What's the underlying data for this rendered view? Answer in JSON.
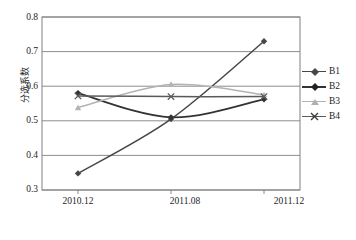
{
  "chart_data": {
    "type": "line",
    "title": "",
    "xlabel": "",
    "ylabel": "分选系数",
    "categories": [
      "2010.12",
      "2011.08",
      "2011.12"
    ],
    "ylim": [
      0.3,
      0.8
    ],
    "yticks": [
      "0.3",
      "0.4",
      "0.5",
      "0.6",
      "0.7",
      "0.8"
    ],
    "ytick_values": [
      0.3,
      0.4,
      0.5,
      0.6,
      0.7,
      0.8
    ],
    "grid": true,
    "legend_position": "right",
    "series": [
      {
        "name": "B1",
        "values": [
          0.348,
          0.505,
          0.73
        ],
        "color": "#474747",
        "marker": "diamond"
      },
      {
        "name": "B2",
        "values": [
          0.58,
          0.51,
          0.562
        ],
        "color": "#333333",
        "marker": "diamond"
      },
      {
        "name": "B3",
        "values": [
          0.538,
          0.605,
          0.575
        ],
        "color": "#b3b3b3",
        "marker": "triangle"
      },
      {
        "name": "B4",
        "values": [
          0.572,
          0.57,
          0.57
        ],
        "color": "#5a5a5a",
        "marker": "cross"
      }
    ]
  },
  "axes": {
    "y_label": "分选系数",
    "y_ticks": [
      "0.8",
      "0.7",
      "0.6",
      "0.5",
      "0.4",
      "0.3"
    ],
    "x_ticks": [
      "2010.12",
      "2011.08",
      "2011.12"
    ]
  },
  "legend": {
    "items": [
      {
        "label": "B1"
      },
      {
        "label": "B2"
      },
      {
        "label": "B3"
      },
      {
        "label": "B4"
      }
    ]
  },
  "style": {
    "plot_border": "#808080",
    "gridline": "#808080",
    "background": "#ffffff"
  }
}
